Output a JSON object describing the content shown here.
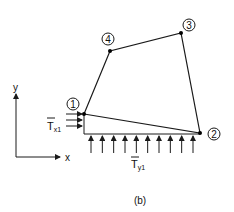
{
  "figure": {
    "caption": "(b)",
    "axes": {
      "x_label": "x",
      "y_label": "y"
    },
    "nodes": [
      {
        "id": "1",
        "label": "1"
      },
      {
        "id": "2",
        "label": "2"
      },
      {
        "id": "3",
        "label": "3"
      },
      {
        "id": "4",
        "label": "4"
      }
    ],
    "element_edges": [
      [
        "1",
        "2"
      ],
      [
        "2",
        "3"
      ],
      [
        "3",
        "4"
      ],
      [
        "4",
        "1"
      ]
    ],
    "tractions": {
      "tx": {
        "symbol": "T",
        "subscript": "x1",
        "overbar": true,
        "arrow_count": 3,
        "direction": "+x",
        "edge": "1"
      },
      "ty": {
        "symbol": "T",
        "subscript": "y1",
        "overbar": true,
        "arrow_count": 10,
        "direction": "+y",
        "edge": "1-2"
      }
    }
  }
}
